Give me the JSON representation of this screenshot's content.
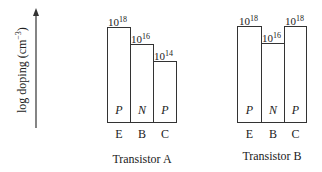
{
  "axis": {
    "ylabel_prefix": "log doping (cm",
    "ylabel_exp": "−3",
    "ylabel_suffix": ")"
  },
  "transistors": [
    {
      "caption": "Transistor A",
      "regions": [
        {
          "terminal": "E",
          "type": "P",
          "base": "10",
          "exp": "18"
        },
        {
          "terminal": "B",
          "type": "N",
          "base": "10",
          "exp": "16"
        },
        {
          "terminal": "C",
          "type": "P",
          "base": "10",
          "exp": "14"
        }
      ]
    },
    {
      "caption": "Transistor B",
      "regions": [
        {
          "terminal": "E",
          "type": "P",
          "base": "10",
          "exp": "18"
        },
        {
          "terminal": "B",
          "type": "N",
          "base": "10",
          "exp": "16"
        },
        {
          "terminal": "C",
          "type": "P",
          "base": "10",
          "exp": "18"
        }
      ]
    }
  ]
}
